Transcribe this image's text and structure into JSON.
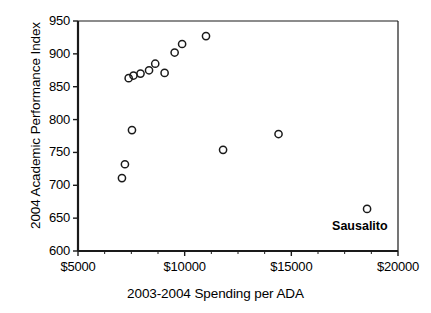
{
  "chart_data": {
    "type": "scatter",
    "title": "",
    "xlabel": "2003-2004 Spending per ADA",
    "ylabel": "2004 Academic Performance Index",
    "xlim": [
      5000,
      20000
    ],
    "ylim": [
      600,
      950
    ],
    "xticks": [
      5000,
      10000,
      15000,
      20000
    ],
    "xtick_labels": [
      "$5000",
      "$10000",
      "$15000",
      "$20000"
    ],
    "yticks": [
      600,
      650,
      700,
      750,
      800,
      850,
      900,
      950
    ],
    "ytick_labels": [
      "600",
      "650",
      "700",
      "750",
      "800",
      "850",
      "900",
      "950"
    ],
    "x_minor_tick_interval": 1250,
    "grid": false,
    "legend": false,
    "marker": "open-circle",
    "marker_color": "#1a1a1a",
    "marker_fill": "none",
    "points": [
      {
        "x": 7060,
        "y": 711
      },
      {
        "x": 7200,
        "y": 732
      },
      {
        "x": 7375,
        "y": 863
      },
      {
        "x": 7530,
        "y": 784
      },
      {
        "x": 7600,
        "y": 867
      },
      {
        "x": 7930,
        "y": 870
      },
      {
        "x": 8330,
        "y": 875
      },
      {
        "x": 8620,
        "y": 885
      },
      {
        "x": 9060,
        "y": 871
      },
      {
        "x": 9530,
        "y": 902
      },
      {
        "x": 9880,
        "y": 915
      },
      {
        "x": 11000,
        "y": 927
      },
      {
        "x": 11800,
        "y": 754
      },
      {
        "x": 14400,
        "y": 778
      },
      {
        "x": 18550,
        "y": 664
      }
    ],
    "annotations": [
      {
        "label": "Sausalito",
        "x": 18550,
        "y": 664
      }
    ]
  },
  "axes": {
    "axis_color": "#1a1a1a",
    "background": "#ffffff"
  }
}
